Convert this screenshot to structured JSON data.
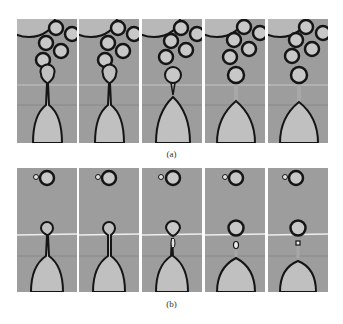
{
  "figure": {
    "rows": [
      {
        "label": "(a)",
        "description": "Time sequence of droplet pinch-off from nozzle with crowded droplets above",
        "frames": [
          {
            "index": 1,
            "neck": "thin continuous",
            "drop_attached": true
          },
          {
            "index": 2,
            "neck": "thinner continuous",
            "drop_attached": true
          },
          {
            "index": 3,
            "neck": "pinching",
            "drop_attached": true
          },
          {
            "index": 4,
            "neck": "broken",
            "drop_attached": false
          },
          {
            "index": 5,
            "neck": "broken, meniscus retracted",
            "drop_attached": false
          }
        ]
      },
      {
        "label": "(b)",
        "description": "Time sequence of droplet pinch-off forming a satellite droplet, with single large and small droplet above",
        "frames": [
          {
            "index": 1,
            "neck": "thin continuous",
            "satellite": false
          },
          {
            "index": 2,
            "neck": "thinning",
            "satellite": false
          },
          {
            "index": 3,
            "neck": "pinching",
            "satellite": false
          },
          {
            "index": 4,
            "neck": "broken",
            "satellite": true
          },
          {
            "index": 5,
            "neck": "broken, meniscus retracted",
            "satellite": true
          }
        ]
      }
    ]
  },
  "colors": {
    "background": "#9d9d9d",
    "outline": "#151515",
    "droplet_fill": "#c8c8c8",
    "highlight_line": "#e8e8e8"
  }
}
